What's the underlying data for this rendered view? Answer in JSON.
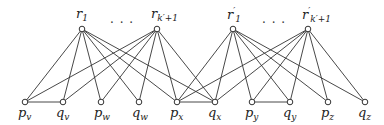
{
  "diagram": {
    "type": "bipartite-graph",
    "colors": {
      "edge": "#333333",
      "node_fill": "#ffffff",
      "node_stroke": "#333333"
    },
    "top_nodes": [
      {
        "id": "r1",
        "base": "r",
        "prime": "",
        "sub": "1",
        "x": 82,
        "y": 29
      },
      {
        "id": "rk1",
        "base": "r",
        "prime": "",
        "sub": "k′+1",
        "x": 157,
        "y": 29
      },
      {
        "id": "rp1",
        "base": "r",
        "prime": "′",
        "sub": "1",
        "x": 233,
        "y": 29
      },
      {
        "id": "rpk1",
        "base": "r",
        "prime": "′",
        "sub": "k′+1",
        "x": 308,
        "y": 29
      }
    ],
    "ellipses": [
      {
        "text": "· · ·",
        "x": 110,
        "y": 16
      },
      {
        "text": "· · ·",
        "x": 262,
        "y": 16
      }
    ],
    "bottom_nodes": [
      {
        "id": "pv",
        "base": "p",
        "sub": "v",
        "x": 25,
        "y": 102
      },
      {
        "id": "qv",
        "base": "q",
        "sub": "v",
        "x": 63,
        "y": 102
      },
      {
        "id": "pw",
        "base": "p",
        "sub": "w",
        "x": 101,
        "y": 102
      },
      {
        "id": "qw",
        "base": "q",
        "sub": "w",
        "x": 139,
        "y": 102
      },
      {
        "id": "px",
        "base": "p",
        "sub": "x",
        "x": 177,
        "y": 102
      },
      {
        "id": "qx",
        "base": "q",
        "sub": "x",
        "x": 215,
        "y": 102
      },
      {
        "id": "py",
        "base": "p",
        "sub": "y",
        "x": 252,
        "y": 102
      },
      {
        "id": "qy",
        "base": "q",
        "sub": "y",
        "x": 290,
        "y": 102
      },
      {
        "id": "pz",
        "base": "p",
        "sub": "z",
        "x": 328,
        "y": 102
      },
      {
        "id": "qz",
        "base": "q",
        "sub": "z",
        "x": 365,
        "y": 102
      }
    ],
    "edges": [
      [
        "r1",
        "pv"
      ],
      [
        "r1",
        "qv"
      ],
      [
        "r1",
        "pw"
      ],
      [
        "r1",
        "qw"
      ],
      [
        "r1",
        "px"
      ],
      [
        "r1",
        "qx"
      ],
      [
        "rk1",
        "pv"
      ],
      [
        "rk1",
        "qv"
      ],
      [
        "rk1",
        "pw"
      ],
      [
        "rk1",
        "qw"
      ],
      [
        "rk1",
        "px"
      ],
      [
        "rk1",
        "qx"
      ],
      [
        "rp1",
        "px"
      ],
      [
        "rp1",
        "qx"
      ],
      [
        "rp1",
        "py"
      ],
      [
        "rp1",
        "qy"
      ],
      [
        "rp1",
        "pz"
      ],
      [
        "rp1",
        "qz"
      ],
      [
        "rpk1",
        "px"
      ],
      [
        "rpk1",
        "qx"
      ],
      [
        "rpk1",
        "py"
      ],
      [
        "rpk1",
        "qy"
      ],
      [
        "rpk1",
        "pz"
      ],
      [
        "rpk1",
        "qz"
      ],
      [
        "pv",
        "qv"
      ],
      [
        "px",
        "qx"
      ],
      [
        "py",
        "qy"
      ]
    ]
  }
}
